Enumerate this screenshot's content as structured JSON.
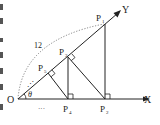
{
  "diagram": {
    "type": "geometry",
    "labels": {
      "origin": "O",
      "x_axis": "X",
      "y_axis": "Y",
      "angle": "θ",
      "length": "12",
      "ellipsis_ray": "⋰",
      "ellipsis_axis": "···",
      "points": [
        {
          "name": "P",
          "sub": "1"
        },
        {
          "name": "P",
          "sub": "2"
        },
        {
          "name": "P",
          "sub": "3"
        },
        {
          "name": "P",
          "sub": "4"
        },
        {
          "name": "P",
          "sub": "5"
        }
      ]
    },
    "colors": {
      "line": "#222222",
      "dotted": "#666666",
      "background": "#ffffff"
    }
  }
}
